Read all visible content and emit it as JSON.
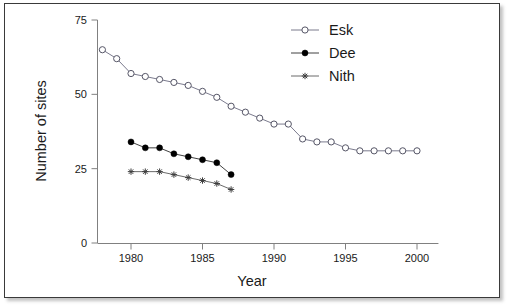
{
  "chart_data": {
    "type": "line",
    "title": "",
    "xlabel": "Year",
    "ylabel": "Number of sites",
    "xlim": [
      1977.5,
      2001.5
    ],
    "ylim": [
      0,
      75
    ],
    "xticks": [
      1980,
      1985,
      1990,
      1995,
      2000
    ],
    "yticks": [
      0,
      25,
      50,
      75
    ],
    "grid": false,
    "legend_position": "top-right",
    "series": [
      {
        "name": "Esk",
        "marker": "open-circle",
        "color": "#555566",
        "x": [
          1978,
          1979,
          1980,
          1981,
          1982,
          1983,
          1984,
          1985,
          1986,
          1987,
          1988,
          1989,
          1990,
          1991,
          1992,
          1993,
          1994,
          1995,
          1996,
          1997,
          1998,
          1999,
          2000
        ],
        "values": [
          65,
          62,
          57,
          56,
          55,
          54,
          53,
          51,
          49,
          46,
          44,
          42,
          40,
          40,
          35,
          34,
          34,
          32,
          31,
          31,
          31,
          31,
          31
        ]
      },
      {
        "name": "Dee",
        "marker": "filled-circle",
        "color": "#000000",
        "x": [
          1980,
          1981,
          1982,
          1983,
          1984,
          1985,
          1986,
          1987
        ],
        "values": [
          34,
          32,
          32,
          30,
          29,
          28,
          27,
          23
        ]
      },
      {
        "name": "Nith",
        "marker": "star",
        "color": "#3d3d3d",
        "x": [
          1980,
          1981,
          1982,
          1983,
          1984,
          1985,
          1986,
          1987
        ],
        "values": [
          24,
          24,
          24,
          23,
          22,
          21,
          20,
          18
        ]
      }
    ]
  },
  "legend": {
    "items": [
      {
        "label": "Esk"
      },
      {
        "label": "Dee"
      },
      {
        "label": "Nith"
      }
    ]
  },
  "axes": {
    "y_title": "Number of sites",
    "x_title": "Year",
    "y_tick_labels": [
      "0",
      "25",
      "50",
      "75"
    ],
    "x_tick_labels": [
      "1980",
      "1985",
      "1990",
      "1995",
      "2000"
    ]
  }
}
